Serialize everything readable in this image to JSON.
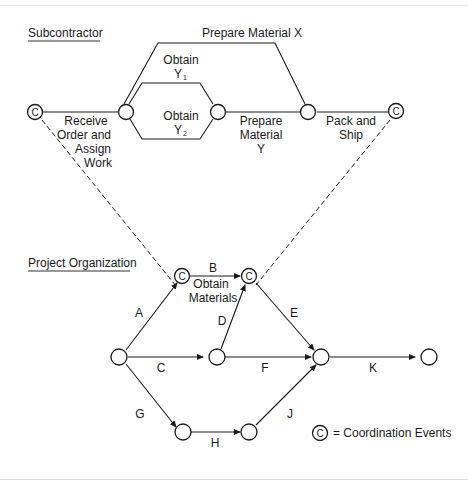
{
  "sections": {
    "subcontractor": "Subcontractor",
    "project_organization": "Project Organization"
  },
  "subcontractor_activities": {
    "prepare_x": "Prepare Material X",
    "obtain_y1_line1": "Obtain",
    "obtain_y1_line2": "Y",
    "obtain_y1_sub": "1",
    "obtain_y2_line1": "Obtain",
    "obtain_y2_line2": "Y",
    "obtain_y2_sub": "2",
    "receive_line1": "Receive",
    "receive_line2": "Order and",
    "receive_line3": "Assign",
    "receive_line4": "Work",
    "prepare_y_line1": "Prepare",
    "prepare_y_line2": "Material",
    "prepare_y_line3": "Y",
    "pack_line1": "Pack and",
    "pack_line2": "Ship"
  },
  "project_activities": {
    "A": "A",
    "B": "B",
    "B_desc_line1": "Obtain",
    "B_desc_line2": "Materials",
    "C": "C",
    "D": "D",
    "E": "E",
    "F": "F",
    "G": "G",
    "H": "H",
    "J": "J",
    "K": "K"
  },
  "coordination_symbol": "C",
  "legend": {
    "symbol": "C",
    "text": "= Coordination Events"
  }
}
